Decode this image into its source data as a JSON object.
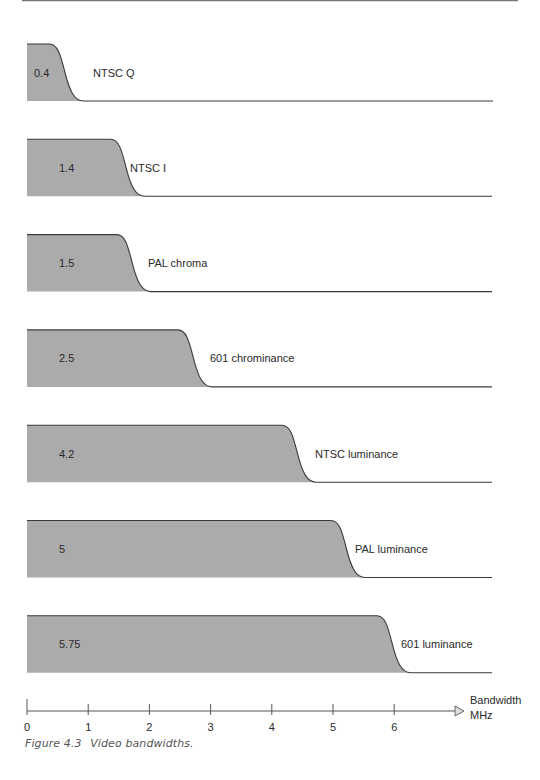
{
  "chart_data": {
    "type": "area",
    "title": "Video bandwidths",
    "xlabel": "Bandwidth MHz",
    "ylabel": "",
    "xlim": [
      0,
      7
    ],
    "x_ticks": [
      0,
      1,
      2,
      3,
      4,
      5,
      6
    ],
    "grid": false,
    "legend": "none",
    "series": [
      {
        "name": "NTSC Q",
        "value": 0.4,
        "value_label": "0.4"
      },
      {
        "name": "NTSC I",
        "value": 1.4,
        "value_label": "1.4"
      },
      {
        "name": "PAL chroma",
        "value": 1.5,
        "value_label": "1.5"
      },
      {
        "name": "601 chrominance",
        "value": 2.5,
        "value_label": "2.5"
      },
      {
        "name": "NTSC luminance",
        "value": 4.2,
        "value_label": "4.2"
      },
      {
        "name": "PAL luminance",
        "value": 5,
        "value_label": "5"
      },
      {
        "name": "601 luminance",
        "value": 5.75,
        "value_label": "5.75"
      }
    ]
  },
  "axis": {
    "label_line1": "Bandwidth",
    "label_line2": "MHz"
  },
  "caption": {
    "number": "Figure 4.3",
    "text": "Video bandwidths."
  },
  "colors": {
    "fill": "#ababab",
    "stroke": "#3a3a3a",
    "text": "#2a2a2a",
    "rule": "#777777"
  }
}
